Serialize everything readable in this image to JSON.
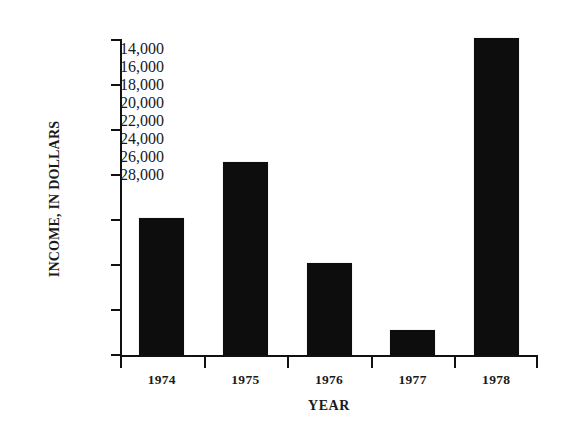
{
  "chart_data": {
    "type": "bar",
    "title": "",
    "xlabel": "YEAR",
    "ylabel": "INCOME, IN DOLLARS",
    "categories": [
      "1974",
      "1975",
      "1976",
      "1977",
      "1978"
    ],
    "values": [
      20100,
      22600,
      18100,
      15100,
      28100
    ],
    "ylim": [
      14000,
      28000
    ],
    "ytick_labels": [
      "14,000",
      "16,000",
      "18,000",
      "20,000",
      "22,000",
      "24,000",
      "26,000",
      "28,000"
    ],
    "ytick_values": [
      14000,
      16000,
      18000,
      20000,
      22000,
      24000,
      26000,
      28000
    ],
    "grid": "off",
    "legend": "none",
    "bar_color": "#0d0d0d",
    "axis_color": "#111111",
    "background_color": "#ffffff"
  },
  "axis": {
    "y_title": "INCOME, IN DOLLARS",
    "x_title": "YEAR"
  }
}
